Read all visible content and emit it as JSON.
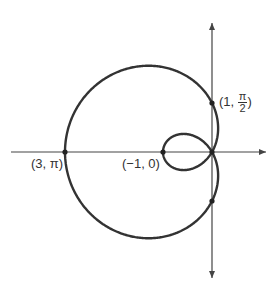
{
  "diagram": {
    "type": "polar-curve",
    "equation": "r = 1 - 2cos(theta)",
    "origin_px": [
      212,
      152
    ],
    "scale_px_per_unit": 49,
    "colors": {
      "curve": "#333333",
      "axis": "#444444",
      "label": "#333333"
    },
    "axes": {
      "horizontal": {
        "x1": 11,
        "x2": 266,
        "y": 152
      },
      "vertical": {
        "x": 212,
        "y1": 23,
        "y2": 278
      }
    },
    "points": [
      {
        "label": "(3, π)",
        "r": 3,
        "theta": "π"
      },
      {
        "label": "(−1, 0)",
        "r": -1,
        "theta": "0"
      },
      {
        "label_prefix": "(1, ",
        "frac_num": "π",
        "frac_den": "2",
        "label_suffix": ")",
        "r": 1,
        "theta": "π/2"
      }
    ],
    "labels": {
      "p_three_pi": "(3, π)",
      "p_neg_one_zero": "(−1, 0)",
      "p_one_half_pi_prefix": "(1, ",
      "p_one_half_pi_num": "π",
      "p_one_half_pi_den": "2",
      "p_one_half_pi_suffix": ")"
    }
  }
}
